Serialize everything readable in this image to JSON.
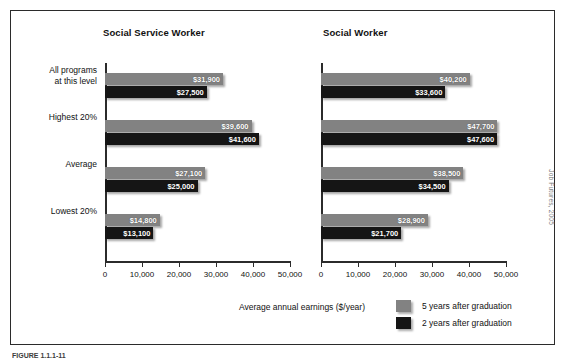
{
  "credit": "Job Futures, 2005",
  "caption": "FIGURE 1.1.1-11",
  "axis_title": "Average annual earnings ($/year)",
  "legend": {
    "position": "bottom-right",
    "entries": [
      {
        "label": "5 years after graduation",
        "color": "#828282",
        "key": "g5"
      },
      {
        "label": "2 years after graduation",
        "color": "#151515",
        "key": "g2"
      }
    ]
  },
  "chart_data": {
    "type": "bar",
    "orientation": "horizontal",
    "title": "",
    "xlabel": "Average annual earnings ($/year)",
    "ylabel": "",
    "xlim": [
      0,
      50000
    ],
    "xticks": [
      0,
      10000,
      20000,
      30000,
      40000,
      50000
    ],
    "xtick_labels": [
      "0",
      "10,000",
      "20,000",
      "30,000",
      "40,000",
      "50,000"
    ],
    "grid": false,
    "categories": [
      "All programs\nat this level",
      "Highest 20%",
      "Average",
      "Lowest 20%"
    ],
    "panels": [
      {
        "title": "Social Service Worker",
        "series": [
          {
            "name": "5 years after graduation",
            "color": "#828282",
            "values": [
              31900,
              39600,
              27100,
              14800
            ],
            "labels": [
              "$31,900",
              "$39,600",
              "$27,100",
              "$14,800"
            ]
          },
          {
            "name": "2 years after graduation",
            "color": "#151515",
            "values": [
              27500,
              41600,
              25000,
              13100
            ],
            "labels": [
              "$27,500",
              "$41,600",
              "$25,000",
              "$13,100"
            ]
          }
        ]
      },
      {
        "title": "Social Worker",
        "series": [
          {
            "name": "5 years after graduation",
            "color": "#828282",
            "values": [
              40200,
              47700,
              38500,
              28900
            ],
            "labels": [
              "$40,200",
              "$47,700",
              "$38,500",
              "$28,900"
            ]
          },
          {
            "name": "2 years after graduation",
            "color": "#151515",
            "values": [
              33600,
              47600,
              34500,
              21700
            ],
            "labels": [
              "$33,600",
              "$47,600",
              "$34,500",
              "$21,700"
            ]
          }
        ]
      }
    ]
  }
}
